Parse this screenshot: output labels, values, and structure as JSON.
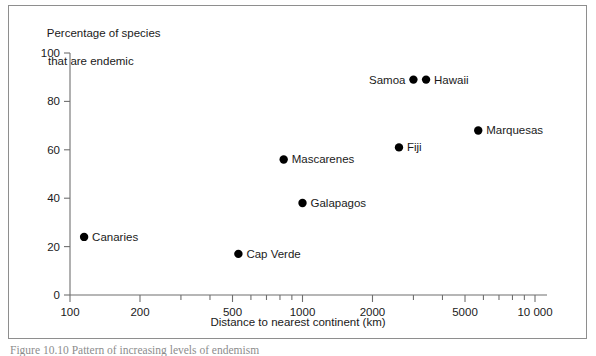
{
  "figure": {
    "caption": "Figure 10.10  Pattern of increasing levels of endemism"
  },
  "axes": {
    "ylabel_line1": "Percentage of species",
    "ylabel_line2": "that are endemic",
    "xlabel": "Distance to nearest continent (km)",
    "y_ticks": [
      "0",
      "20",
      "40",
      "60",
      "80",
      "100"
    ],
    "x_ticks": [
      "100",
      "200",
      "500",
      "1000",
      "2000",
      "5000",
      "10 000"
    ]
  },
  "chart_data": {
    "type": "scatter",
    "title": "",
    "xlabel": "Distance to nearest continent (km)",
    "ylabel": "Percentage of species that are endemic",
    "xscale": "log",
    "yscale": "linear",
    "xlim": [
      100,
      10000
    ],
    "ylim": [
      0,
      100
    ],
    "grid": false,
    "legend": false,
    "xtick_values": [
      100,
      200,
      500,
      1000,
      2000,
      5000,
      10000
    ],
    "xtick_labels": [
      "100",
      "200",
      "500",
      "1000",
      "2000",
      "5000",
      "10 000"
    ],
    "ytick_values": [
      0,
      20,
      40,
      60,
      80,
      100
    ],
    "ytick_labels": [
      "0",
      "20",
      "40",
      "60",
      "80",
      "100"
    ],
    "points": [
      {
        "label": "Canaries",
        "x": 115,
        "y": 24,
        "label_side": "right"
      },
      {
        "label": "Cap Verde",
        "x": 530,
        "y": 17,
        "label_side": "right"
      },
      {
        "label": "Mascarenes",
        "x": 830,
        "y": 56,
        "label_side": "right"
      },
      {
        "label": "Galapagos",
        "x": 1000,
        "y": 38,
        "label_side": "right"
      },
      {
        "label": "Fiji",
        "x": 2600,
        "y": 61,
        "label_side": "right"
      },
      {
        "label": "Samoa",
        "x": 3000,
        "y": 89,
        "label_side": "left"
      },
      {
        "label": "Hawaii",
        "x": 3400,
        "y": 89,
        "label_side": "right"
      },
      {
        "label": "Marquesas",
        "x": 5700,
        "y": 68,
        "label_side": "right"
      }
    ]
  }
}
